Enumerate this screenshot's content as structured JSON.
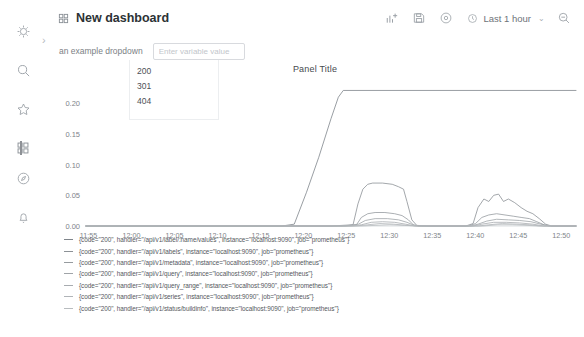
{
  "sidebar": {
    "items": [
      {
        "name": "grafana-logo-icon",
        "label": "Grafana"
      },
      {
        "name": "search-icon",
        "label": "Search"
      },
      {
        "name": "star-icon",
        "label": "Starred"
      },
      {
        "name": "dashboards-grid-icon",
        "label": "Dashboards"
      },
      {
        "name": "compass-icon",
        "label": "Explore"
      },
      {
        "name": "bell-icon",
        "label": "Alerting"
      }
    ],
    "expand_chevron": "›"
  },
  "topbar": {
    "title": "New dashboard",
    "add_panel_label": "Add panel",
    "save_label": "Save dashboard",
    "settings_label": "Dashboard settings",
    "time_range": "Last 1 hour",
    "time_caret": "⌄",
    "zoom_out_label": "Zoom out time range"
  },
  "variables": {
    "label": "an example dropdown",
    "input_value": "",
    "placeholder": "Enter variable value",
    "options": [
      "200",
      "301",
      "404"
    ]
  },
  "panel": {
    "title": "Panel Title"
  },
  "chart_data": {
    "type": "line",
    "title": "Panel Title",
    "xlabel": "",
    "ylabel": "",
    "ylim": [
      0,
      0.225
    ],
    "yticks": [
      "0.00",
      "0.05",
      "0.10",
      "0.15",
      "0.20"
    ],
    "ytick_values": [
      0,
      0.05,
      0.1,
      0.15,
      0.2
    ],
    "xticks": [
      "11:55",
      "12:00",
      "12:05",
      "12:10",
      "12:15",
      "12:20",
      "12:25",
      "12:30",
      "12:35",
      "12:40",
      "12:45",
      "12:50"
    ],
    "grid": false,
    "legend_position": "bottom",
    "series": [
      {
        "name": "{code=\"200\", handler=\"/api/v1/label/:name/values\", instance=\"localhost:9090\", job=\"prometheus\"}",
        "color": "#7f858b",
        "points": [
          [
            0,
            0
          ],
          [
            0.36,
            0
          ],
          [
            0.4,
            0
          ],
          [
            0.425,
            0.003
          ],
          [
            0.45,
            0.055
          ],
          [
            0.475,
            0.112
          ],
          [
            0.5,
            0.175
          ],
          [
            0.515,
            0.21
          ],
          [
            0.525,
            0.221
          ],
          [
            0.6,
            0.221
          ],
          [
            0.7,
            0.221
          ],
          [
            0.8,
            0.221
          ],
          [
            0.9,
            0.221
          ],
          [
            1.0,
            0.221
          ]
        ]
      },
      {
        "name": "{code=\"200\", handler=\"/api/v1/labels\", instance=\"localhost:9090\", job=\"prometheus\"}",
        "color": "#8c9196",
        "points": [
          [
            0,
            0
          ],
          [
            0.5,
            0
          ],
          [
            0.545,
            0.002
          ],
          [
            0.555,
            0.036
          ],
          [
            0.565,
            0.06
          ],
          [
            0.575,
            0.068
          ],
          [
            0.585,
            0.07
          ],
          [
            0.605,
            0.07
          ],
          [
            0.625,
            0.068
          ],
          [
            0.638,
            0.064
          ],
          [
            0.648,
            0.06
          ],
          [
            0.655,
            0.04
          ],
          [
            0.665,
            0.01
          ],
          [
            0.675,
            0.001
          ],
          [
            0.7,
            0
          ],
          [
            0.775,
            0
          ],
          [
            0.79,
            0.004
          ],
          [
            0.8,
            0.03
          ],
          [
            0.812,
            0.044
          ],
          [
            0.822,
            0.04
          ],
          [
            0.832,
            0.05
          ],
          [
            0.842,
            0.052
          ],
          [
            0.852,
            0.04
          ],
          [
            0.862,
            0.044
          ],
          [
            0.875,
            0.038
          ],
          [
            0.888,
            0.03
          ],
          [
            0.9,
            0.024
          ],
          [
            0.912,
            0.02
          ],
          [
            0.925,
            0.012
          ],
          [
            0.938,
            0.003
          ],
          [
            0.95,
            0
          ],
          [
            1.0,
            0
          ]
        ]
      },
      {
        "name": "{code=\"200\", handler=\"/api/v1/metadata\", instance=\"localhost:9090\", job=\"prometheus\"}",
        "color": "#969b9f",
        "points": [
          [
            0,
            0
          ],
          [
            0.52,
            0
          ],
          [
            0.552,
            0.002
          ],
          [
            0.562,
            0.014
          ],
          [
            0.575,
            0.02
          ],
          [
            0.59,
            0.022
          ],
          [
            0.61,
            0.022
          ],
          [
            0.63,
            0.02
          ],
          [
            0.645,
            0.017
          ],
          [
            0.658,
            0.01
          ],
          [
            0.668,
            0.002
          ],
          [
            0.68,
            0
          ],
          [
            0.78,
            0
          ],
          [
            0.795,
            0.004
          ],
          [
            0.808,
            0.014
          ],
          [
            0.822,
            0.018
          ],
          [
            0.838,
            0.02
          ],
          [
            0.855,
            0.018
          ],
          [
            0.872,
            0.016
          ],
          [
            0.888,
            0.014
          ],
          [
            0.905,
            0.012
          ],
          [
            0.92,
            0.007
          ],
          [
            0.935,
            0.002
          ],
          [
            0.948,
            0
          ],
          [
            1.0,
            0
          ]
        ]
      },
      {
        "name": "{code=\"200\", handler=\"/api/v1/query\", instance=\"localhost:9090\", job=\"prometheus\"}",
        "color": "#a0a4a8",
        "points": [
          [
            0,
            0
          ],
          [
            0.53,
            0
          ],
          [
            0.556,
            0.003
          ],
          [
            0.57,
            0.009
          ],
          [
            0.59,
            0.012
          ],
          [
            0.615,
            0.012
          ],
          [
            0.638,
            0.01
          ],
          [
            0.655,
            0.006
          ],
          [
            0.67,
            0.001
          ],
          [
            0.682,
            0
          ],
          [
            0.785,
            0
          ],
          [
            0.8,
            0.003
          ],
          [
            0.818,
            0.008
          ],
          [
            0.838,
            0.011
          ],
          [
            0.862,
            0.01
          ],
          [
            0.885,
            0.009
          ],
          [
            0.908,
            0.007
          ],
          [
            0.928,
            0.003
          ],
          [
            0.945,
            0
          ],
          [
            1.0,
            0
          ]
        ]
      },
      {
        "name": "{code=\"200\", handler=\"/api/v1/query_range\", instance=\"localhost:9090\", job=\"prometheus\"}",
        "color": "#a8acb0",
        "points": [
          [
            0,
            0
          ],
          [
            0.54,
            0
          ],
          [
            0.562,
            0.002
          ],
          [
            0.582,
            0.006
          ],
          [
            0.605,
            0.007
          ],
          [
            0.63,
            0.006
          ],
          [
            0.652,
            0.003
          ],
          [
            0.672,
            0
          ],
          [
            0.79,
            0
          ],
          [
            0.808,
            0.003
          ],
          [
            0.832,
            0.006
          ],
          [
            0.858,
            0.006
          ],
          [
            0.885,
            0.005
          ],
          [
            0.912,
            0.003
          ],
          [
            0.935,
            0
          ],
          [
            1.0,
            0
          ]
        ]
      },
      {
        "name": "{code=\"200\", handler=\"/api/v1/series\", instance=\"localhost:9090\", job=\"prometheus\"}",
        "color": "#b0b4b8",
        "points": [
          [
            0,
            0
          ],
          [
            0.55,
            0
          ],
          [
            0.575,
            0.002
          ],
          [
            0.6,
            0.004
          ],
          [
            0.628,
            0.003
          ],
          [
            0.655,
            0.001
          ],
          [
            0.675,
            0
          ],
          [
            0.8,
            0
          ],
          [
            0.822,
            0.002
          ],
          [
            0.85,
            0.004
          ],
          [
            0.878,
            0.003
          ],
          [
            0.905,
            0.002
          ],
          [
            0.928,
            0
          ],
          [
            1.0,
            0
          ]
        ]
      },
      {
        "name": "{code=\"200\", handler=\"/api/v1/status/buildinfo\", instance=\"localhost:9090\", job=\"prometheus\"}",
        "color": "#b8bcbf",
        "points": [
          [
            0,
            0
          ],
          [
            0.56,
            0
          ],
          [
            0.59,
            0.001
          ],
          [
            0.62,
            0.002
          ],
          [
            0.65,
            0.001
          ],
          [
            0.678,
            0
          ],
          [
            0.81,
            0
          ],
          [
            0.84,
            0.002
          ],
          [
            0.87,
            0.002
          ],
          [
            0.9,
            0.001
          ],
          [
            0.925,
            0
          ],
          [
            1.0,
            0
          ]
        ]
      }
    ]
  }
}
